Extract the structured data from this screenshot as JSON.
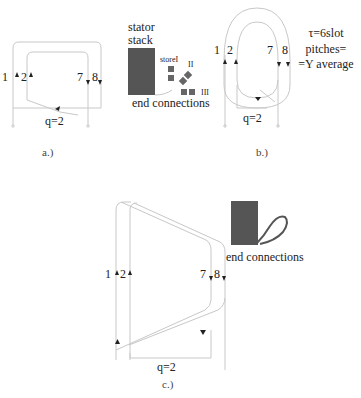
{
  "panels": {
    "a": {
      "caption": "a.)",
      "left_labels": "1",
      "left_labels2": "2",
      "right_label7": "7",
      "right_label8": "8",
      "q_label": "q=2"
    },
    "stator": {
      "title_line1": "stator",
      "title_line2": "stack",
      "layer1": "storeI",
      "layer2": "II",
      "layer3": "III",
      "end_label": "end connections"
    },
    "b": {
      "caption": "b.)",
      "label1": "1",
      "label2": "2",
      "label7": "7",
      "label8": "8",
      "q_label": "q=2",
      "note_line1": "τ=6slot",
      "note_line2": "pitches=",
      "note_line3": "=Y average"
    },
    "c": {
      "caption": "c.)",
      "label1": "1",
      "label2": "2",
      "label7": "7",
      "label8": "8",
      "q_label": "q=2",
      "end_label": "end connections"
    }
  },
  "colors": {
    "line": "#c8c8c8",
    "block": "#555555",
    "arrow": "#222222"
  }
}
